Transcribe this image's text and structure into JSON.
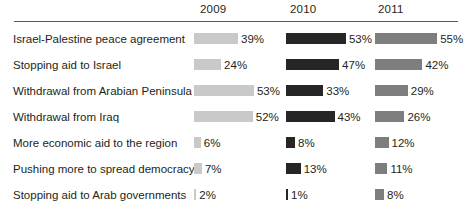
{
  "chart_data": {
    "type": "bar",
    "title": "",
    "subtitle": "",
    "xlabel": "",
    "ylabel": "",
    "orientation": "horizontal",
    "grouped": true,
    "grid": false,
    "legend_position": "top-as-column-headers",
    "value_suffix": "%",
    "axis_max_percent": 60,
    "categories": [
      "Israel-Palestine peace agreement",
      "Stopping aid to Israel",
      "Withdrawal from Arabian Peninsula",
      "Withdrawal from Iraq",
      "More economic aid to the region",
      "Pushing more to spread democracy",
      "Stopping aid to Arab governments"
    ],
    "series": [
      {
        "name": "2009",
        "color": "#c9c9c9",
        "values": [
          39,
          24,
          53,
          52,
          6,
          7,
          2
        ],
        "labels": [
          "39%",
          "24%",
          "53%",
          "52%",
          "6%",
          "7%",
          "2%"
        ]
      },
      {
        "name": "2010",
        "color": "#262626",
        "values": [
          53,
          47,
          33,
          43,
          8,
          13,
          1
        ],
        "labels": [
          "53%",
          "47%",
          "33%",
          "43%",
          "8%",
          "13%",
          "1%"
        ]
      },
      {
        "name": "2011",
        "color": "#7e7e7e",
        "values": [
          55,
          42,
          29,
          26,
          12,
          11,
          8
        ],
        "labels": [
          "55%",
          "42%",
          "29%",
          "26%",
          "12%",
          "11%",
          "8%"
        ]
      }
    ]
  },
  "header": {
    "years": [
      "2009",
      "2010",
      "2011"
    ]
  },
  "layout": {
    "column_origins_px": [
      194,
      286,
      375
    ],
    "px_per_percent": 1.13,
    "row_top_px": 26,
    "row_height_px": 26,
    "bar_height_px": 11,
    "value_gap_px": 3,
    "year_label_left_px": [
      200,
      290,
      378
    ]
  }
}
